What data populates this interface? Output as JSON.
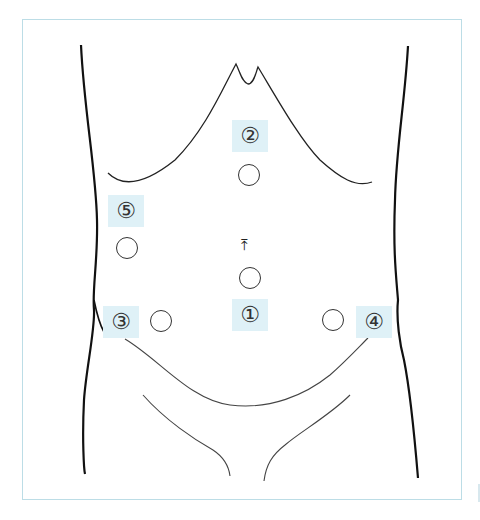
{
  "diagram": {
    "type": "abdominal port placement",
    "colors": {
      "label_bg": "#dff1f7",
      "frame_border": "#bcdde6",
      "outline": "#222222",
      "port_stroke": "#333333"
    },
    "labels": [
      {
        "id": "1",
        "text": "①",
        "x": 232,
        "y": 299
      },
      {
        "id": "2",
        "text": "②",
        "x": 232,
        "y": 120
      },
      {
        "id": "3",
        "text": "③",
        "x": 103,
        "y": 306
      },
      {
        "id": "4",
        "text": "④",
        "x": 356,
        "y": 306
      },
      {
        "id": "5",
        "text": "⑤",
        "x": 108,
        "y": 195
      }
    ],
    "ports": [
      {
        "near": "1",
        "cx": 250,
        "cy": 277
      },
      {
        "near": "2",
        "cx": 249,
        "cy": 175
      },
      {
        "near": "3",
        "cx": 161,
        "cy": 321
      },
      {
        "near": "4",
        "cx": 333,
        "cy": 320
      },
      {
        "near": "5",
        "cx": 127,
        "cy": 248
      }
    ],
    "navel": {
      "glyph": "⤒",
      "x": 243,
      "y": 240
    }
  }
}
